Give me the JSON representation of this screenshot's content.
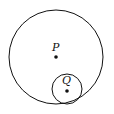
{
  "diagram": {
    "outer_circle": {
      "center_label": "P",
      "cx": 56,
      "cy": 57,
      "r": 47
    },
    "inner_circle": {
      "center_label": "Q",
      "cx": 67,
      "cy": 89,
      "r": 15
    },
    "labels": {
      "p": "P",
      "q": "Q"
    },
    "stroke_color": "#111111"
  }
}
